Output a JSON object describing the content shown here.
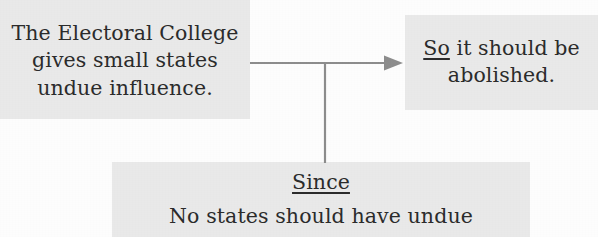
{
  "page": {
    "background_color": "#fdfdfd",
    "box_fill_color": "#e9e9e9",
    "text_color": "#2b2b2b",
    "connector_color": "#8d8d8d"
  },
  "diagram": {
    "type": "argument-map",
    "claim_box": {
      "lines": [
        "The Electoral College",
        "gives small states",
        "undue influence."
      ]
    },
    "conclusion_box": {
      "connective": "So",
      "lines": [
        " it should be",
        "abolished."
      ]
    },
    "reason_box": {
      "connective": "Since",
      "lines": [
        "No states should have undue"
      ]
    },
    "connector": {
      "kind": "arrow-with-branch",
      "label": "arrow from claim to conclusion with branch down to reason"
    }
  }
}
